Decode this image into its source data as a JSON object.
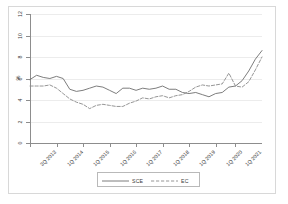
{
  "chart_data": {
    "type": "line",
    "title": "",
    "subtitle": "",
    "xlabel": "",
    "ylabel": "%",
    "ylim": [
      0,
      12
    ],
    "yticks": [
      0,
      2,
      4,
      6,
      8,
      10,
      12
    ],
    "ytick_labels": [
      "0",
      "2",
      "4",
      "6",
      "8",
      "10",
      "12"
    ],
    "grid": true,
    "grid_axis": "y",
    "legend_position": "bottom-center",
    "xtick_labels": [
      "3Q 2013",
      "1Q 2014",
      "1Q 2015",
      "1Q 2016",
      "1Q 2017",
      "1Q 2018",
      "1Q 2019",
      "1Q 2020",
      "1Q 2021"
    ],
    "x": [
      "3Q2013",
      "4Q2013",
      "1Q2014",
      "2Q2014",
      "3Q2014",
      "4Q2014",
      "1Q2015",
      "2Q2015",
      "3Q2015",
      "4Q2015",
      "1Q2016",
      "2Q2016",
      "3Q2016",
      "4Q2016",
      "1Q2017",
      "2Q2017",
      "3Q2017",
      "4Q2017",
      "1Q2018",
      "2Q2018",
      "3Q2018",
      "4Q2018",
      "1Q2019",
      "2Q2019",
      "3Q2019",
      "4Q2019",
      "1Q2020",
      "2Q2020",
      "3Q2020",
      "4Q2020",
      "1Q2021",
      "2Q2021",
      "3Q2021",
      "4Q2021",
      "1Q2022",
      "2Q2022"
    ],
    "series": [
      {
        "name": "SCE",
        "style": "solid",
        "color": "#6e6e6e",
        "values": [
          5.9,
          6.3,
          6.1,
          6.0,
          6.2,
          6.0,
          5.0,
          4.8,
          4.9,
          5.1,
          5.3,
          5.2,
          4.9,
          4.6,
          5.1,
          5.1,
          4.9,
          5.1,
          5.0,
          5.1,
          5.3,
          5.0,
          5.0,
          4.7,
          4.6,
          4.7,
          4.5,
          4.3,
          4.6,
          4.7,
          5.2,
          5.3,
          5.8,
          6.7,
          7.8,
          8.6
        ]
      },
      {
        "name": "EC",
        "style": "dashed",
        "color": "#8a8a8a",
        "values": [
          5.3,
          5.3,
          5.3,
          5.4,
          5.1,
          4.6,
          4.1,
          3.8,
          3.6,
          3.2,
          3.5,
          3.6,
          3.5,
          3.4,
          3.4,
          3.7,
          3.9,
          4.2,
          4.1,
          4.3,
          4.4,
          4.2,
          4.4,
          4.5,
          4.8,
          5.2,
          5.4,
          5.3,
          5.4,
          5.5,
          6.5,
          5.3,
          5.2,
          5.7,
          6.8,
          8.0
        ]
      }
    ]
  },
  "legend": {
    "entries": [
      {
        "label": "SCE",
        "style": "solid"
      },
      {
        "label": "EC",
        "style": "dashed"
      }
    ]
  }
}
